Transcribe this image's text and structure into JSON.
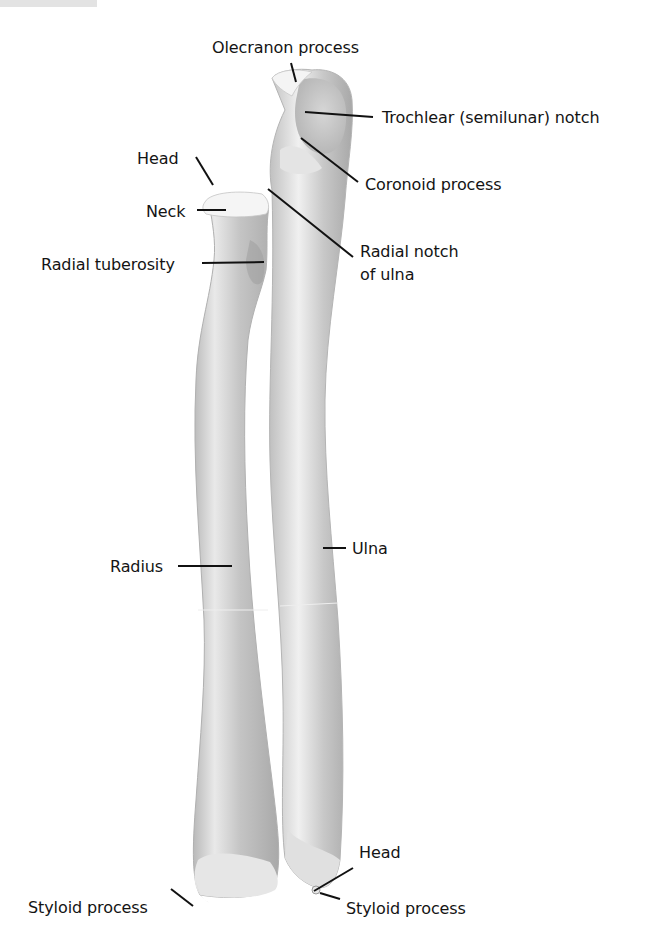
{
  "figure": {
    "bones": [
      "Radius",
      "Ulna"
    ],
    "labels": {
      "olecranon": "Olecranon process",
      "trochlear": "Trochlear (semilunar) notch",
      "coronoid": "Coronoid process",
      "radial_notch_1": "Radial notch",
      "radial_notch_2": "of ulna",
      "radial_head": "Head",
      "neck": "Neck",
      "tuberosity": "Radial tuberosity",
      "radius": "Radius",
      "ulna": "Ulna",
      "ulna_head": "Head",
      "radial_styloid": "Styloid process",
      "ulnar_styloid": "Styloid process"
    }
  },
  "colors": {
    "bone_light": "#f1f1f1",
    "bone_mid": "#c9c9c9",
    "bone_dark": "#a7a7a7",
    "leader_line": "#111111",
    "text": "#141414"
  }
}
